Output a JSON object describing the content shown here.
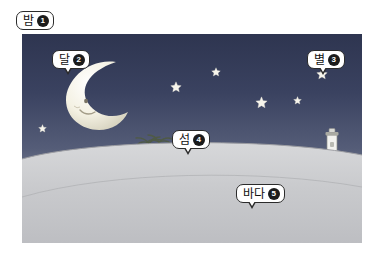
{
  "scene": {
    "title_label": "밤",
    "colors": {
      "sky_top": "#2e3550",
      "sky_bottom": "#d8d9dd",
      "sea": "#c8cace",
      "callout_border": "#2b2b2b",
      "badge_bg": "#1b1b1b",
      "moon": "#f2efe4",
      "star": "#f6f4ea"
    },
    "callouts": [
      {
        "id": "night",
        "label": "밤",
        "number": "1",
        "name": "callout-night",
        "tail": false,
        "x": 16,
        "y": 11
      },
      {
        "id": "moon",
        "label": "달",
        "number": "2",
        "name": "callout-moon",
        "tail": true,
        "x": 52,
        "y": 50
      },
      {
        "id": "star",
        "label": "별",
        "number": "3",
        "name": "callout-star",
        "tail": true,
        "x": 307,
        "y": 50
      },
      {
        "id": "island",
        "label": "섬",
        "number": "4",
        "name": "callout-island",
        "tail": true,
        "x": 172,
        "y": 130
      },
      {
        "id": "sea",
        "label": "바다",
        "number": "5",
        "name": "callout-sea",
        "tail": true,
        "x": 236,
        "y": 184
      }
    ],
    "stars": [
      {
        "name": "star-1",
        "x": 38,
        "y": 119,
        "size": 9
      },
      {
        "name": "star-2",
        "x": 170,
        "y": 79,
        "size": 12
      },
      {
        "name": "star-3",
        "x": 211,
        "y": 63,
        "size": 10
      },
      {
        "name": "star-4",
        "x": 255,
        "y": 95,
        "size": 13
      },
      {
        "name": "star-5",
        "x": 293,
        "y": 91,
        "size": 9
      },
      {
        "name": "star-6",
        "x": 316,
        "y": 66,
        "size": 12
      }
    ],
    "objects": {
      "moon_name": "crescent-moon",
      "island_name": "island-with-palm-trees",
      "lighthouse_name": "lighthouse",
      "sea_name": "sea-surface",
      "sky_name": "night-sky"
    }
  }
}
